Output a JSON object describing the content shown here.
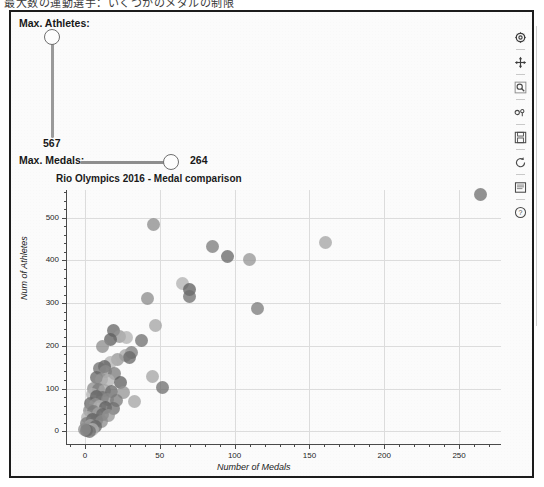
{
  "window": {
    "clipped_top_text": "最大数の運動選手：いくつかのメダルの制限"
  },
  "controls": {
    "athletes_slider": {
      "label": "Max. Athletes:",
      "value": "567",
      "orientation": "vertical",
      "handle_position_pct": 0
    },
    "medals_slider": {
      "label": "Max. Medals:",
      "value": "264",
      "orientation": "horizontal",
      "handle_position_pct": 100
    }
  },
  "toolbar": {
    "items": [
      {
        "name": "configure-icon",
        "title": "Configure"
      },
      {
        "name": "move-icon",
        "title": "Pan"
      },
      {
        "name": "zoom-icon",
        "title": "Zoom"
      },
      {
        "name": "subplots-icon",
        "title": "Subplots"
      },
      {
        "name": "save-icon",
        "title": "Save"
      },
      {
        "name": "refresh-icon",
        "title": "Refresh"
      },
      {
        "name": "print-icon",
        "title": "Print"
      },
      {
        "name": "help-icon",
        "title": "Help"
      }
    ]
  },
  "chart_data": {
    "type": "scatter",
    "title": "Rio Olympics 2016 - Medal comparison",
    "xlabel": "Number of Medals",
    "ylabel": "Num of Athletes",
    "xlim": [
      -12,
      278
    ],
    "ylim": [
      -30,
      565
    ],
    "xticks": [
      0,
      50,
      100,
      150,
      200,
      250
    ],
    "yticks": [
      0,
      100,
      200,
      300,
      400,
      500
    ],
    "grid": true,
    "legend": "none",
    "marker_size": 13,
    "marker_opacity": 0.75,
    "points": [
      {
        "x": 264,
        "y": 554
      },
      {
        "x": 46,
        "y": 485
      },
      {
        "x": 85,
        "y": 432
      },
      {
        "x": 161,
        "y": 441
      },
      {
        "x": 95,
        "y": 409
      },
      {
        "x": 110,
        "y": 402
      },
      {
        "x": 65,
        "y": 347
      },
      {
        "x": 70,
        "y": 331
      },
      {
        "x": 70,
        "y": 315
      },
      {
        "x": 42,
        "y": 312
      },
      {
        "x": 115,
        "y": 287
      },
      {
        "x": 47,
        "y": 248
      },
      {
        "x": 19,
        "y": 236
      },
      {
        "x": 23,
        "y": 222
      },
      {
        "x": 28,
        "y": 219
      },
      {
        "x": 17,
        "y": 214
      },
      {
        "x": 38,
        "y": 213
      },
      {
        "x": 12,
        "y": 199
      },
      {
        "x": 31,
        "y": 184
      },
      {
        "x": 27,
        "y": 178
      },
      {
        "x": 30,
        "y": 173
      },
      {
        "x": 22,
        "y": 168
      },
      {
        "x": 17,
        "y": 162
      },
      {
        "x": 13,
        "y": 152
      },
      {
        "x": 10,
        "y": 147
      },
      {
        "x": 14,
        "y": 140
      },
      {
        "x": 20,
        "y": 136
      },
      {
        "x": 45,
        "y": 128
      },
      {
        "x": 8,
        "y": 126
      },
      {
        "x": 11,
        "y": 121
      },
      {
        "x": 16,
        "y": 118
      },
      {
        "x": 24,
        "y": 115
      },
      {
        "x": 52,
        "y": 102
      },
      {
        "x": 6,
        "y": 101
      },
      {
        "x": 9,
        "y": 98
      },
      {
        "x": 13,
        "y": 96
      },
      {
        "x": 18,
        "y": 93
      },
      {
        "x": 26,
        "y": 90
      },
      {
        "x": 5,
        "y": 86
      },
      {
        "x": 8,
        "y": 81
      },
      {
        "x": 12,
        "y": 78
      },
      {
        "x": 15,
        "y": 74
      },
      {
        "x": 21,
        "y": 72
      },
      {
        "x": 33,
        "y": 70
      },
      {
        "x": 4,
        "y": 66
      },
      {
        "x": 7,
        "y": 62
      },
      {
        "x": 10,
        "y": 59
      },
      {
        "x": 14,
        "y": 56
      },
      {
        "x": 19,
        "y": 53
      },
      {
        "x": 3,
        "y": 48
      },
      {
        "x": 6,
        "y": 45
      },
      {
        "x": 9,
        "y": 42
      },
      {
        "x": 12,
        "y": 39
      },
      {
        "x": 16,
        "y": 36
      },
      {
        "x": 2,
        "y": 31
      },
      {
        "x": 5,
        "y": 28
      },
      {
        "x": 8,
        "y": 25
      },
      {
        "x": 11,
        "y": 22
      },
      {
        "x": 1,
        "y": 17
      },
      {
        "x": 4,
        "y": 14
      },
      {
        "x": 7,
        "y": 11
      },
      {
        "x": 2,
        "y": 7
      },
      {
        "x": 5,
        "y": 5
      },
      {
        "x": 1,
        "y": 2
      },
      {
        "x": 3,
        "y": 0
      },
      {
        "x": 0,
        "y": 3
      }
    ]
  }
}
